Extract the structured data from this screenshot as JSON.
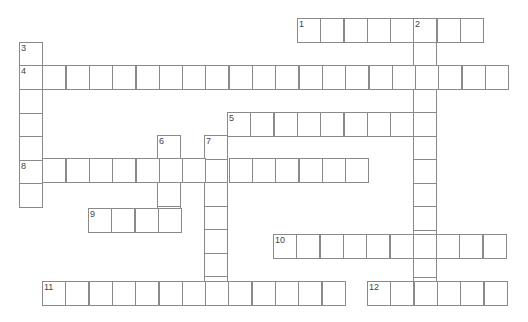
{
  "puzzle": {
    "cell_width": 23.3,
    "cell_height": 23.5,
    "line_color": "#8a8a8a",
    "words": [
      {
        "number": "1",
        "direction": "across",
        "x": 297,
        "y": 18,
        "length": 8
      },
      {
        "number": "2",
        "direction": "down",
        "x": 413,
        "y": 18,
        "length": 12
      },
      {
        "number": "3",
        "direction": "down",
        "x": 19,
        "y": 42,
        "length": 7
      },
      {
        "number": "4",
        "direction": "across",
        "x": 19,
        "y": 65,
        "length": 21
      },
      {
        "number": "5",
        "direction": "across",
        "x": 227,
        "y": 112,
        "length": 9
      },
      {
        "number": "6",
        "direction": "down",
        "x": 157,
        "y": 135,
        "length": 4
      },
      {
        "number": "7",
        "direction": "down",
        "x": 204,
        "y": 135,
        "length": 7
      },
      {
        "number": "8",
        "direction": "across",
        "x": 19,
        "y": 158,
        "length": 15
      },
      {
        "number": "9",
        "direction": "across",
        "x": 88,
        "y": 208,
        "length": 4
      },
      {
        "number": "10",
        "direction": "across",
        "x": 273,
        "y": 234,
        "length": 10
      },
      {
        "number": "11",
        "direction": "across",
        "x": 42,
        "y": 281,
        "length": 13
      },
      {
        "number": "12",
        "direction": "across",
        "x": 367,
        "y": 281,
        "length": 6
      }
    ]
  }
}
